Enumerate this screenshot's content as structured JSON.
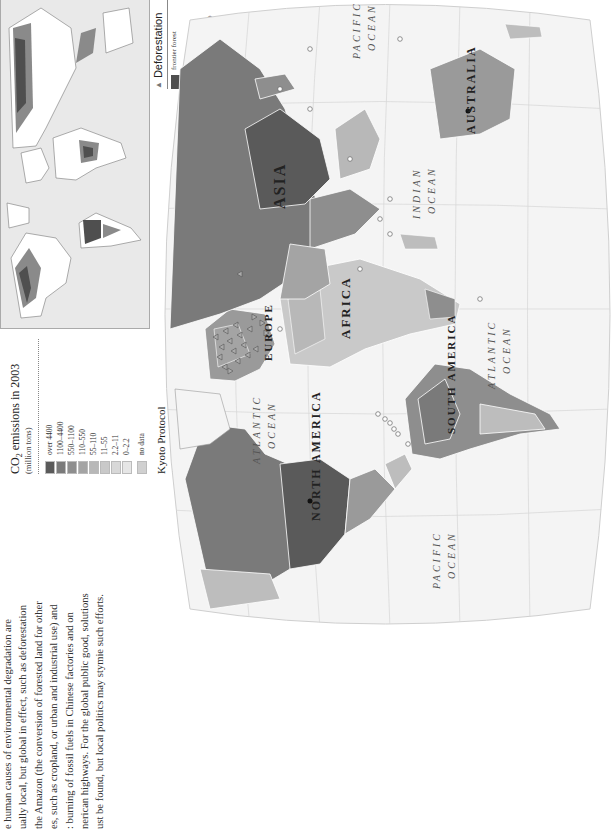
{
  "paragraph": {
    "lines": [
      "e human causes of environmental degradation are",
      "ually local, but global in effect, such as deforestation",
      "the Amazon (the conversion of forested land for other",
      "es, such as cropland, or urban and industrial use) and",
      ": burning of fossil fuels in Chinese factories and on",
      "nerican highways. For the global public good, solutions",
      "ust be found, but local politics may stymie such efforts."
    ]
  },
  "co2_legend": {
    "title_prefix": "CO",
    "title_sub": "2",
    "title_suffix": " emissions in 2003",
    "subtitle": "(million tons)",
    "items": [
      {
        "label": "over 4400",
        "color": "#5a5a5a"
      },
      {
        "label": "1100–4400",
        "color": "#7a7a7a"
      },
      {
        "label": "550–1100",
        "color": "#8e8e8e"
      },
      {
        "label": "110–550",
        "color": "#a4a4a4"
      },
      {
        "label": "55–110",
        "color": "#b8b8b8"
      },
      {
        "label": "11–55",
        "color": "#c9c9c9"
      },
      {
        "label": "2.2–11",
        "color": "#d8d8d8"
      },
      {
        "label": "0–2.2",
        "color": "#e6e6e6"
      },
      {
        "label": "no data",
        "color": "#d0d0d0"
      }
    ]
  },
  "kyoto_legend": {
    "title": "Kyoto Protocol",
    "items": [
      {
        "symbol": "triangle-up",
        "glyph": "▲",
        "label": "countries that have reached targets"
      },
      {
        "symbol": "triangle-down",
        "glyph": "▼",
        "label": "countries that have not reached targets"
      },
      {
        "symbol": "dot",
        "glyph": "●",
        "label": "industrialized countries that have not ratified Kyoto Protocol"
      }
    ]
  },
  "deforestation_legend": {
    "title": "Deforestation",
    "glyph": "▲",
    "items": [
      {
        "label": "frontier forest",
        "color": "#4f4f4f"
      },
      {
        "label": "degraded forest",
        "color": "#8a8a8a"
      },
      {
        "label": "frontier forest 8000 years ago",
        "color": "#c8c8c8"
      }
    ]
  },
  "map": {
    "continents": [
      "NORTH AMERICA",
      "SOUTH AMERICA",
      "EUROPE",
      "AFRICA",
      "ASIA",
      "AUSTRALIA"
    ],
    "oceans": [
      {
        "line1": "PACIFIC",
        "line2": "OCEAN"
      },
      {
        "line1": "ATLANTIC",
        "line2": "OCEAN"
      },
      {
        "line1": "ATLANTIC",
        "line2": "OCEAN"
      },
      {
        "line1": "INDIAN",
        "line2": "OCEAN"
      },
      {
        "line1": "PACIFIC",
        "line2": "OCEAN"
      }
    ],
    "colors": {
      "sea": "#f4f4f4",
      "graticule": "#cfcfcf",
      "darkest": "#5a5a5a",
      "dark": "#7a7a7a",
      "mid": "#9a9a9a",
      "light": "#bdbdbd",
      "lighter": "#d6d6d6"
    }
  }
}
